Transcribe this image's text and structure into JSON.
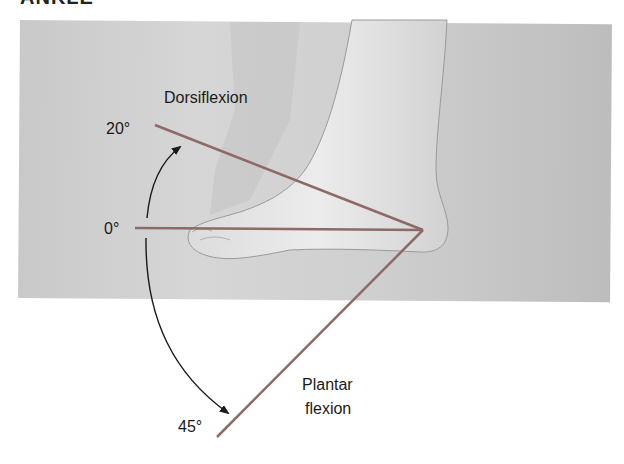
{
  "heading": "ANKLE",
  "labels": {
    "dorsiflexion": "Dorsiflexion",
    "plantar_line1": "Plantar",
    "plantar_line2": "flexion",
    "deg_20": "20°",
    "deg_0": "0°",
    "deg_45": "45°"
  },
  "colors": {
    "angle_line": "#8c6a66",
    "arrow": "#1a1a1a",
    "photo_bg": "#cccccc"
  },
  "angles": {
    "dorsiflexion_deg": 20,
    "neutral_deg": 0,
    "plantarflexion_deg": 45
  }
}
